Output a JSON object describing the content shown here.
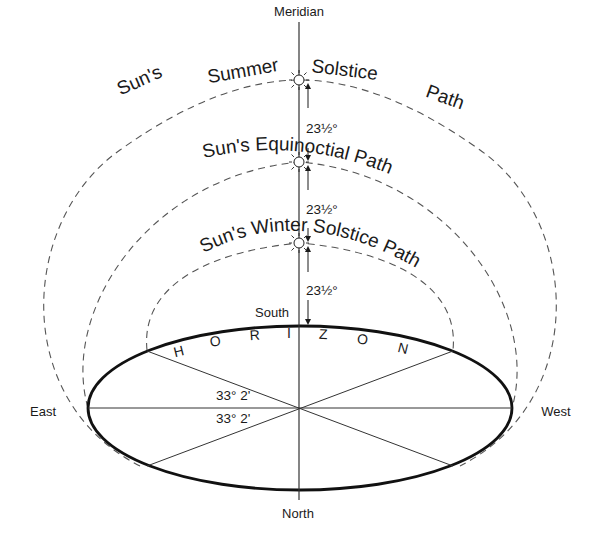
{
  "labels": {
    "meridian": "Meridian",
    "south": "South",
    "north": "North",
    "east": "East",
    "west": "West"
  },
  "paths": {
    "summer": [
      "Sun's",
      "Summer",
      "Solstice",
      "Path"
    ],
    "equinoctial": "Sun's Equinoctial Path",
    "winter": "Sun's Winter Solstice Path"
  },
  "angles": {
    "upper": "23½°",
    "middle": "23½°",
    "lower": "23½°",
    "horizon_upper": "33° 2'",
    "horizon_lower": "33° 2'"
  },
  "horizon_letters": [
    "H",
    "O",
    "R",
    "I",
    "Z",
    "O",
    "N"
  ],
  "colors": {
    "line": "#1a1a1a",
    "dashed": "#555555",
    "background": "#ffffff"
  }
}
